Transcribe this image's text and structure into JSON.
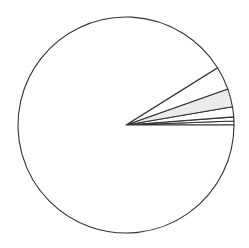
{
  "chart_data": {
    "type": "pie",
    "title": "",
    "legend": [],
    "start_angle_deg": 0,
    "direction": "counterclockwise",
    "center": [
      126,
      125
    ],
    "radius": 108,
    "stroke_color": "#333333",
    "slices": [
      {
        "label": "",
        "value": 0.6,
        "color": "#ffffff"
      },
      {
        "label": "",
        "value": 0.6,
        "color": "#ffffff"
      },
      {
        "label": "",
        "value": 1.5,
        "color": "#ffffff"
      },
      {
        "label": "",
        "value": 2.7,
        "color": "#ebebeb"
      },
      {
        "label": "",
        "value": 3.5,
        "color": "#ffffff"
      },
      {
        "label": "",
        "value": 91.1,
        "color": "#ffffff"
      }
    ]
  }
}
